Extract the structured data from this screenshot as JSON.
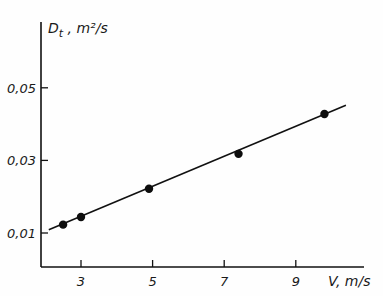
{
  "chart_data": {
    "type": "line",
    "title": "",
    "xlabel": "V, m/s",
    "ylabel": "D_t , m²/s",
    "ylabel_main": "D",
    "ylabel_sub": "t",
    "ylabel_unit": " , m²/s",
    "xlim": [
      1.9,
      10.6
    ],
    "ylim": [
      0.0,
      0.061
    ],
    "x_ticks": [
      3,
      5,
      7,
      9
    ],
    "x_tick_labels": [
      "3",
      "5",
      "7",
      "9"
    ],
    "y_ticks": [
      0.01,
      0.03,
      0.05
    ],
    "y_tick_labels": [
      "0,01",
      "0,03",
      "0,05"
    ],
    "grid": false,
    "legend": null,
    "series": [
      {
        "name": "measured",
        "style": "markers",
        "x": [
          2.5,
          3.0,
          4.9,
          7.4,
          9.8
        ],
        "y": [
          0.0123,
          0.0144,
          0.0222,
          0.0318,
          0.0428
        ]
      },
      {
        "name": "linear fit",
        "style": "line",
        "x": [
          2.1,
          10.4
        ],
        "y": [
          0.0109,
          0.0452
        ]
      }
    ]
  }
}
